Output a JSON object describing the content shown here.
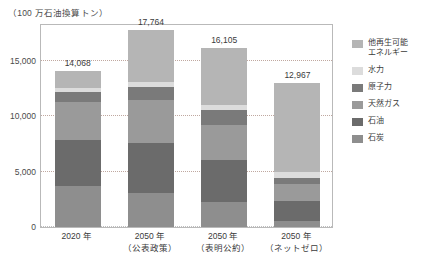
{
  "chart_data": {
    "type": "bar",
    "stacked": true,
    "title": "（100 万石油換算トン）",
    "xlabel": "",
    "ylabel": "",
    "ylim": [
      0,
      18400
    ],
    "grid": true,
    "legend_position": "right",
    "yticks": [
      "0",
      "5,000",
      "10,000",
      "15,000"
    ],
    "ytick_values": [
      0,
      5000,
      10000,
      15000
    ],
    "categories": [
      {
        "line1": "2020 年",
        "line2": ""
      },
      {
        "line1": "2050 年",
        "line2": "（公表政策）"
      },
      {
        "line1": "2050 年",
        "line2": "（表明公約）"
      },
      {
        "line1": "2050 年",
        "line2": "（ネットゼロ）"
      }
    ],
    "totals": [
      "14,068",
      "17,764",
      "16,105",
      "12,967"
    ],
    "total_values": [
      14068,
      17764,
      16105,
      12967
    ],
    "series": [
      {
        "name": "石炭",
        "color": "#8e8e8e",
        "values": [
          3700,
          3050,
          2250,
          550
        ]
      },
      {
        "name": "石油",
        "color": "#6b6b6b",
        "values": [
          4150,
          4500,
          3800,
          1800
        ]
      },
      {
        "name": "天然ガス",
        "color": "#9a9a9a",
        "values": [
          3450,
          3900,
          3150,
          1500
        ]
      },
      {
        "name": "原子力",
        "color": "#7a7a7a",
        "values": [
          900,
          1200,
          1350,
          600
        ]
      },
      {
        "name": "水力",
        "color": "#dcdcdc",
        "values": [
          380,
          430,
          470,
          480
        ]
      },
      {
        "name": "他再生可能エネルギー",
        "color": "#b5b5b5",
        "values": [
          1488,
          4684,
          5085,
          8037
        ]
      }
    ],
    "legend": [
      {
        "label": "他再生可能\nエネルギー",
        "color": "#b5b5b5"
      },
      {
        "label": "水力",
        "color": "#dcdcdc"
      },
      {
        "label": "原子力",
        "color": "#7a7a7a"
      },
      {
        "label": "天然ガス",
        "color": "#9a9a9a"
      },
      {
        "label": "石油",
        "color": "#6b6b6b"
      },
      {
        "label": "石炭",
        "color": "#8e8e8e"
      }
    ]
  }
}
